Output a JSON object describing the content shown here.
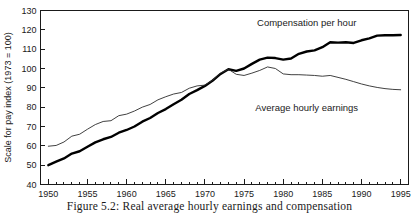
{
  "caption": "Figure 5.2: Real average hourly earnings and compensation",
  "chart_data": {
    "type": "line",
    "title": "",
    "xlabel": "",
    "ylabel": "Scale for pay index (1973 = 100)",
    "xlim": [
      1949,
      1996
    ],
    "ylim": [
      40,
      130
    ],
    "grid": false,
    "legend_position": "inline-annotations",
    "xticks": [
      1950,
      1955,
      1960,
      1965,
      1970,
      1975,
      1980,
      1985,
      1990,
      1995
    ],
    "xtick_labels": [
      "1950",
      "1955",
      "1960",
      "1965",
      "1970",
      "1975",
      "1980",
      "1985",
      "1990",
      "1995"
    ],
    "minor_xtick_interval": 1,
    "yticks": [
      40,
      50,
      60,
      70,
      80,
      90,
      100,
      110,
      120,
      130
    ],
    "ytick_labels": [
      "40",
      "50",
      "60",
      "70",
      "80",
      "90",
      "100",
      "110",
      "120",
      "130"
    ],
    "x": [
      1950,
      1951,
      1952,
      1953,
      1954,
      1955,
      1956,
      1957,
      1958,
      1959,
      1960,
      1961,
      1962,
      1963,
      1964,
      1965,
      1966,
      1967,
      1968,
      1969,
      1970,
      1971,
      1972,
      1973,
      1974,
      1975,
      1976,
      1977,
      1978,
      1979,
      1980,
      1981,
      1982,
      1983,
      1984,
      1985,
      1986,
      1987,
      1988,
      1989,
      1990,
      1991,
      1992,
      1993,
      1994,
      1995
    ],
    "series": [
      {
        "name": "Compensation per hour",
        "style": "thick",
        "values": [
          50.0,
          51.8,
          53.5,
          56.0,
          57.2,
          59.5,
          61.8,
          63.4,
          64.6,
          66.8,
          68.2,
          70.0,
          72.5,
          74.4,
          77.0,
          79.0,
          81.5,
          83.8,
          86.8,
          88.8,
          91.0,
          93.8,
          97.2,
          99.6,
          98.8,
          100.0,
          102.4,
          104.6,
          105.6,
          105.4,
          104.6,
          105.2,
          107.6,
          108.8,
          109.4,
          111.0,
          113.6,
          113.4,
          113.6,
          113.2,
          114.6,
          115.6,
          117.0,
          117.2,
          117.2,
          117.3
        ]
      },
      {
        "name": "Average hourly earnings",
        "style": "thin",
        "values": [
          59.8,
          60.2,
          62.0,
          65.0,
          66.0,
          68.6,
          71.0,
          72.6,
          73.0,
          75.6,
          76.4,
          78.0,
          80.0,
          81.4,
          83.8,
          85.4,
          86.8,
          87.6,
          89.8,
          91.0,
          91.4,
          94.0,
          97.6,
          99.6,
          97.0,
          96.4,
          97.6,
          99.0,
          100.8,
          100.0,
          97.2,
          96.8,
          96.8,
          96.6,
          96.4,
          96.0,
          96.4,
          95.4,
          94.4,
          93.2,
          92.0,
          91.0,
          90.2,
          89.6,
          89.2,
          89.0
        ]
      }
    ],
    "annotations": [
      {
        "text": "Compensation per hour",
        "x": 1983.0,
        "y": 122.0
      },
      {
        "text": "Average hourly earnings",
        "x": 1983.0,
        "y": 78.0
      }
    ]
  }
}
